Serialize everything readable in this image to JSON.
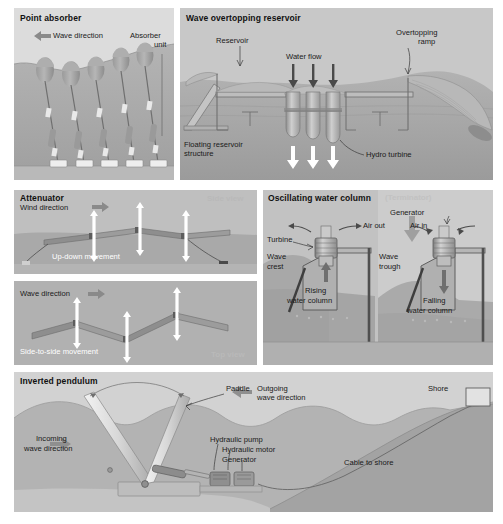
{
  "figure": {
    "type": "technical-diagram",
    "palette": {
      "sky": "#dcdcdc",
      "water_light": "#c3c3c3",
      "water_mid": "#a9a9a9",
      "water_dark": "#8f8f8f",
      "seabed": "#9c9c9c",
      "structure": "#b5b5b5",
      "structure_dark": "#7d7d7d",
      "white_arrow": "#ffffff",
      "gray_arrow": "#8a8a8a",
      "text": "#1a1a1a",
      "muted_text": "#bdbdbd",
      "page_bg": "#ffffff"
    }
  },
  "panels": {
    "point_absorber": {
      "title": "Point absorber",
      "labels": {
        "wave_direction": "Wave direction",
        "absorber_unit_line1": "Absorber",
        "absorber_unit_line2": "unit"
      },
      "arrow_direction": "left",
      "unit_count": 5,
      "anchor_count": 5
    },
    "wave_overtopping_reservoir": {
      "title": "Wave overtopping reservoir",
      "labels": {
        "reservoir": "Reservoir",
        "water_flow": "Water flow",
        "overtopping_ramp_line1": "Overtopping",
        "overtopping_ramp_line2": "ramp",
        "floating_structure_line1": "Floating reservoir",
        "floating_structure_line2": "structure",
        "hydro_turbine": "Hydro turbine"
      },
      "turbine_count": 3,
      "inflow_arrow_count": 3,
      "outflow_arrow_count": 3
    },
    "attenuator": {
      "title": "Attenuator",
      "views": [
        {
          "view_label": "Side view",
          "direction_label": "Wind direction",
          "direction_arrow": "right",
          "movement_label": "Up-down movement",
          "motion_arrow_count": 3
        },
        {
          "view_label": "Top view",
          "direction_label": "Wave direction",
          "direction_arrow": "right",
          "movement_label": "Side-to-side movement",
          "motion_arrow_count": 3
        }
      ]
    },
    "oscillating_water_column": {
      "title": "Oscillating water column",
      "subtitle": "(Terminator)",
      "labels": {
        "turbine": "Turbine",
        "generator": "Generator",
        "air_out": "Air out",
        "air_in": "Air in",
        "wave_crest_line1": "Wave",
        "wave_crest_line2": "crest",
        "wave_trough_line1": "Wave",
        "wave_trough_line2": "trough",
        "rising_column_line1": "Rising",
        "rising_column_line2": "water column",
        "falling_column_line1": "Falling",
        "falling_column_line2": "water column"
      },
      "chamber_count": 2
    },
    "inverted_pendulum": {
      "title": "Inverted pendulum",
      "labels": {
        "paddle": "Paddle",
        "outgoing_wave_line1": "Outgoing",
        "outgoing_wave_line2": "wave direction",
        "shore": "Shore",
        "incoming_wave_line1": "Incoming",
        "incoming_wave_line2": "wave direction",
        "hydraulic_pump": "Hydraulic pump",
        "hydraulic_motor": "Hydraulic motor",
        "generator": "Generator",
        "cable_to_shore": "Cable to shore"
      },
      "incoming_arrow_direction": "right",
      "outgoing_arrow_direction": "left",
      "paddle_positions": 2
    }
  }
}
